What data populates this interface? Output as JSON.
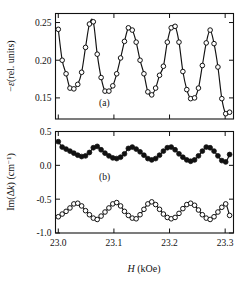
{
  "figure": {
    "panel_a_label": "(a)",
    "panel_b_label": "(b)"
  },
  "axes": {
    "x_label_symbol": "H",
    "x_label_unit": " (kOe)",
    "x_ticks": [
      "23.0",
      "23.1",
      "23.2",
      "23.3"
    ],
    "y_label_a_minus": "−",
    "y_label_a_sym": "ε",
    "y_label_a_rest": "(rel. units)",
    "y_ticks_a": [
      "0.25",
      "0.20",
      "0.15"
    ],
    "y_label_b_pre": "Im(Δ",
    "y_label_b_k": "k",
    "y_label_b_post": ") (cm",
    "y_label_b_sup": "−1",
    "y_label_b_end": ")",
    "y_ticks_b": [
      "0.5",
      "0.0",
      "-0.5",
      "-1.0"
    ]
  },
  "chart_data": [
    {
      "type": "line",
      "panel": "a",
      "title": "",
      "xlabel": "H (kOe)",
      "ylabel": "−ε (rel. units)",
      "xlim": [
        22.995,
        23.315
      ],
      "ylim": [
        0.122,
        0.262
      ],
      "grid": false,
      "legend": "none",
      "marker": "open-circle",
      "x": [
        23.0,
        23.007,
        23.014,
        23.021,
        23.028,
        23.035,
        23.042,
        23.049,
        23.056,
        23.063,
        23.07,
        23.077,
        23.084,
        23.091,
        23.098,
        23.105,
        23.112,
        23.119,
        23.126,
        23.133,
        23.14,
        23.147,
        23.154,
        23.161,
        23.168,
        23.175,
        23.182,
        23.189,
        23.196,
        23.203,
        23.21,
        23.217,
        23.224,
        23.231,
        23.238,
        23.245,
        23.252,
        23.259,
        23.266,
        23.273,
        23.28,
        23.287,
        23.294,
        23.301,
        23.308
      ],
      "values": [
        0.241,
        0.2,
        0.182,
        0.163,
        0.162,
        0.168,
        0.184,
        0.217,
        0.248,
        0.251,
        0.208,
        0.177,
        0.159,
        0.159,
        0.166,
        0.182,
        0.203,
        0.225,
        0.243,
        0.24,
        0.224,
        0.2,
        0.182,
        0.158,
        0.154,
        0.163,
        0.18,
        0.192,
        0.224,
        0.243,
        0.245,
        0.224,
        0.185,
        0.161,
        0.149,
        0.15,
        0.163,
        0.193,
        0.223,
        0.24,
        0.222,
        0.191,
        0.149,
        0.129,
        0.131
      ],
      "ytick_values": [
        0.25,
        0.2,
        0.15
      ],
      "xtick_values": [
        23.0,
        23.1,
        23.2,
        23.3
      ]
    },
    {
      "type": "line",
      "panel": "b",
      "title": "",
      "xlabel": "H (kOe)",
      "ylabel": "Im(Δk) (cm−1)",
      "xlim": [
        22.995,
        23.315
      ],
      "ylim": [
        -1.0,
        0.5
      ],
      "grid": false,
      "legend": "none",
      "ytick_values": [
        0.5,
        0.0,
        -0.5,
        -1.0
      ],
      "xtick_values": [
        23.0,
        23.1,
        23.2,
        23.3
      ],
      "series": [
        {
          "name": "upper",
          "marker": "filled-circle",
          "x": [
            23.0,
            23.007,
            23.014,
            23.021,
            23.028,
            23.035,
            23.042,
            23.049,
            23.056,
            23.063,
            23.07,
            23.077,
            23.084,
            23.091,
            23.098,
            23.105,
            23.112,
            23.119,
            23.126,
            23.133,
            23.14,
            23.147,
            23.154,
            23.161,
            23.168,
            23.175,
            23.182,
            23.189,
            23.196,
            23.203,
            23.21,
            23.217,
            23.224,
            23.231,
            23.238,
            23.245,
            23.252,
            23.259,
            23.266,
            23.273,
            23.28,
            23.287,
            23.294,
            23.301,
            23.308
          ],
          "values": [
            0.35,
            0.27,
            0.24,
            0.21,
            0.18,
            0.15,
            0.13,
            0.14,
            0.19,
            0.26,
            0.28,
            0.23,
            0.18,
            0.14,
            0.11,
            0.1,
            0.12,
            0.17,
            0.25,
            0.27,
            0.24,
            0.2,
            0.15,
            0.1,
            0.08,
            0.1,
            0.15,
            0.21,
            0.26,
            0.27,
            0.23,
            0.17,
            0.12,
            0.08,
            0.06,
            0.08,
            0.14,
            0.21,
            0.27,
            0.26,
            0.21,
            0.14,
            0.07,
            0.05,
            0.16
          ]
        },
        {
          "name": "lower",
          "marker": "open-circle",
          "x": [
            23.0,
            23.007,
            23.014,
            23.021,
            23.028,
            23.035,
            23.042,
            23.049,
            23.056,
            23.063,
            23.07,
            23.077,
            23.084,
            23.091,
            23.098,
            23.105,
            23.112,
            23.119,
            23.126,
            23.133,
            23.14,
            23.147,
            23.154,
            23.161,
            23.168,
            23.175,
            23.182,
            23.189,
            23.196,
            23.203,
            23.21,
            23.217,
            23.224,
            23.231,
            23.238,
            23.245,
            23.252,
            23.259,
            23.266,
            23.273,
            23.28,
            23.287,
            23.294,
            23.301,
            23.308
          ],
          "values": [
            -0.76,
            -0.72,
            -0.68,
            -0.63,
            -0.57,
            -0.56,
            -0.6,
            -0.67,
            -0.73,
            -0.78,
            -0.8,
            -0.75,
            -0.69,
            -0.63,
            -0.57,
            -0.55,
            -0.6,
            -0.68,
            -0.74,
            -0.78,
            -0.79,
            -0.73,
            -0.65,
            -0.57,
            -0.54,
            -0.58,
            -0.65,
            -0.72,
            -0.77,
            -0.79,
            -0.77,
            -0.71,
            -0.64,
            -0.58,
            -0.56,
            -0.59,
            -0.66,
            -0.73,
            -0.78,
            -0.8,
            -0.76,
            -0.69,
            -0.62,
            -0.57,
            -0.74
          ]
        }
      ]
    }
  ]
}
